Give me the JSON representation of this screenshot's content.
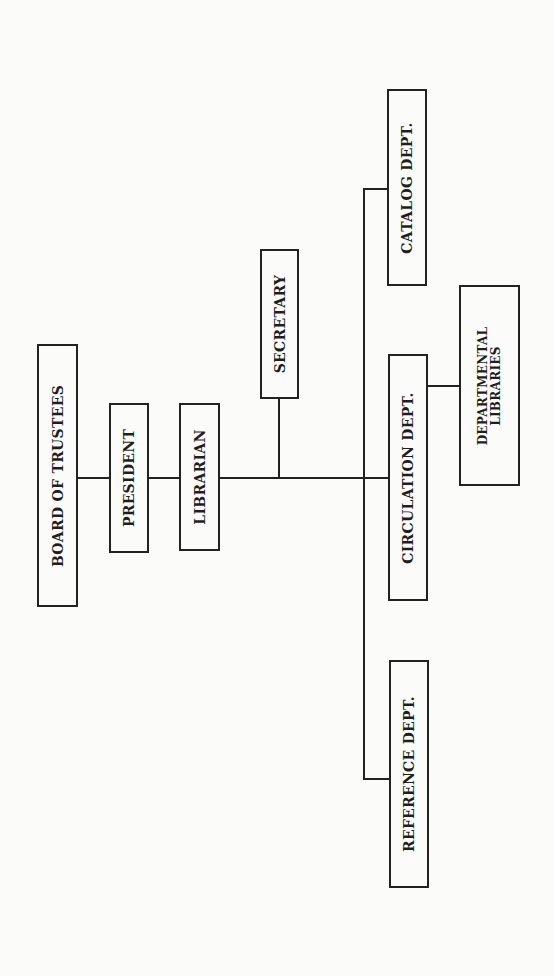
{
  "diagram": {
    "type": "organizational-chart",
    "orientation": "rotated-90-ccw",
    "nodes": {
      "board": {
        "label": "BOARD OF TRUSTEES"
      },
      "president": {
        "label": "PRESIDENT"
      },
      "librarian": {
        "label": "LIBRARIAN"
      },
      "secretary": {
        "label": "SECRETARY"
      },
      "catalog": {
        "label": "CATALOG DEPT."
      },
      "circulation": {
        "label": "CIRCULATION DEPT."
      },
      "reference": {
        "label": "REFERENCE DEPT."
      },
      "departmental": {
        "line1": "DEPARTMENTAL",
        "line2": "LIBRARIES"
      }
    },
    "edges": [
      [
        "BOARD OF TRUSTEES",
        "PRESIDENT"
      ],
      [
        "PRESIDENT",
        "LIBRARIAN"
      ],
      [
        "LIBRARIAN",
        "SECRETARY"
      ],
      [
        "LIBRARIAN",
        "CATALOG DEPT."
      ],
      [
        "LIBRARIAN",
        "CIRCULATION DEPT."
      ],
      [
        "LIBRARIAN",
        "REFERENCE DEPT."
      ],
      [
        "CIRCULATION DEPT.",
        "DEPARTMENTAL LIBRARIES"
      ]
    ],
    "colors": {
      "line": "#222222",
      "background": "#fbfbf9",
      "text": "#1e1e1e"
    }
  }
}
